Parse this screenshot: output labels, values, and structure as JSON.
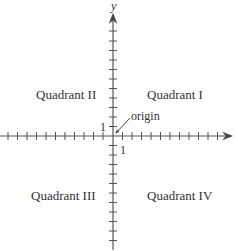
{
  "diagram": {
    "axis_labels": {
      "y": "y",
      "x": ""
    },
    "quadrants": [
      {
        "id": "I",
        "label": "Quadrant I"
      },
      {
        "id": "II",
        "label": "Quadrant II"
      },
      {
        "id": "III",
        "label": "Quadrant III"
      },
      {
        "id": "IV",
        "label": "Quadrant IV"
      }
    ],
    "origin_label": "origin",
    "unit_labels": {
      "x_unit": "1",
      "y_unit": "1"
    },
    "colors": {
      "axis": "#555555",
      "text": "#333333"
    }
  }
}
